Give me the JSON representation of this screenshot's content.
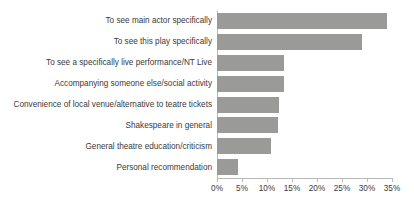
{
  "chart_data": {
    "type": "bar",
    "orientation": "horizontal",
    "title": "",
    "subtitle": "",
    "xlabel": "",
    "ylabel": "",
    "xlim": [
      0,
      35
    ],
    "xtick_values": [
      0,
      5,
      10,
      15,
      20,
      25,
      30,
      35
    ],
    "xtick_labels": [
      "0%",
      "5%",
      "10%",
      "15%",
      "20%",
      "25%",
      "30%",
      "35%"
    ],
    "grid": false,
    "legend": false,
    "value_suffix": "%",
    "series_color": "#9a9a98",
    "axis_color": "#b9b9b9",
    "text_color": "#3a3a3a",
    "background": "#ffffff",
    "categories": [
      "To see main actor specifically",
      "To see this play specifically",
      "To see a specifically live performance/NT Live",
      "Accompanying someone else/social activity",
      "Convenience of local venue/alternative to teatre tickets",
      "Shakespeare in general",
      "General theatre education/criticism",
      "Personal recommendation"
    ],
    "values": [
      34.0,
      29.0,
      13.3,
      13.3,
      12.3,
      12.2,
      10.7,
      4.2
    ]
  }
}
